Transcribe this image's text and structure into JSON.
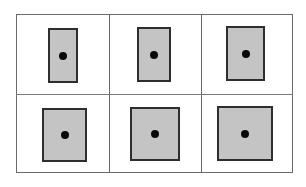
{
  "diagram": {
    "colors": {
      "background": "#ffffff",
      "grid_line": "#6a6a6a",
      "shape_fill": "#c4c4c4",
      "shape_border": "#2e2e2e",
      "dot": "#0a0a0a"
    },
    "grid": {
      "rows": 2,
      "cols": 3,
      "frame": {
        "x": 16,
        "y": 14,
        "width": 277,
        "height": 159
      },
      "vertical_dividers_x": [
        109,
        201
      ],
      "horizontal_divider_y": 94
    },
    "shapes": [
      {
        "row": 1,
        "col": 1,
        "x": 48,
        "y": 28,
        "width": 30,
        "height": 55
      },
      {
        "row": 1,
        "col": 2,
        "x": 137,
        "y": 27,
        "width": 34,
        "height": 55
      },
      {
        "row": 1,
        "col": 3,
        "x": 226,
        "y": 26,
        "width": 39,
        "height": 55
      },
      {
        "row": 2,
        "col": 1,
        "x": 42,
        "y": 108,
        "width": 45,
        "height": 54
      },
      {
        "row": 2,
        "col": 2,
        "x": 130,
        "y": 107,
        "width": 50,
        "height": 54
      },
      {
        "row": 2,
        "col": 3,
        "x": 217,
        "y": 106,
        "width": 56,
        "height": 55
      }
    ]
  }
}
